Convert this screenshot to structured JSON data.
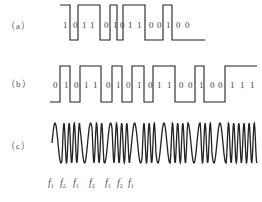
{
  "panels": [
    {
      "label": "（a）",
      "bits": [
        "1",
        "0",
        "1",
        "1",
        "0",
        "1",
        "0",
        "1",
        "1",
        "0",
        "0",
        "1",
        "0",
        "0"
      ],
      "description": "NRZ-style level waveform (non-return-to-zero)"
    },
    {
      "label": "（b）",
      "bits": [
        "0",
        "1",
        "0",
        "1",
        "1",
        "0",
        "1",
        "0",
        "1",
        "0",
        "1",
        "1",
        "0",
        "0",
        "1",
        "0",
        "0",
        "1",
        "1",
        "1"
      ],
      "description": "Level waveform of data bits"
    },
    {
      "label": "（c）",
      "description": "Frequency-shift keyed sinusoid alternating between f1 and f2",
      "freq_labels": [
        {
          "base": "f",
          "sub": "1"
        },
        {
          "base": "f",
          "sub": "2"
        },
        {
          "base": "f",
          "sub": "1"
        },
        {
          "base": "f",
          "sub": "2"
        },
        {
          "base": "f",
          "sub": "1"
        },
        {
          "base": "f",
          "sub": "2"
        },
        {
          "base": "f",
          "sub": "1"
        }
      ]
    }
  ],
  "colors": {
    "stroke": "#222222",
    "text": "#555555",
    "background": "#ffffff"
  }
}
